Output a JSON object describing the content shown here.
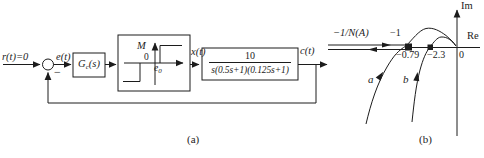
{
  "colors": {
    "ink": "#1c1c1c",
    "background": "#ffffff"
  },
  "figure": {
    "panel_a": {
      "caption": "(a)",
      "input_label": "r(t)=0",
      "error_label": "e(t)",
      "minus_sign": "−",
      "controller": {
        "base": "G",
        "sub": "c",
        "arg": "(s)"
      },
      "nonlinearity": {
        "level_label": "M",
        "origin_label": "0",
        "deadzone_base": "e",
        "deadzone_sub": "0"
      },
      "nl_output_label": "x(t)",
      "plant": {
        "numerator": "10",
        "denominator": "s(0.5s+1)(0.125s+1)"
      },
      "output_label": "c(t)"
    },
    "panel_b": {
      "caption": "(b)",
      "im_axis_label": "Im",
      "re_axis_label": "Re",
      "describing_function_label": "−1/N(A)",
      "critical_point_label": "−1",
      "intersection_a_label": "−0.79",
      "intersection_b_label": "−2.3",
      "origin_label": "0",
      "curve_a_label": "a",
      "curve_b_label": "b"
    }
  }
}
